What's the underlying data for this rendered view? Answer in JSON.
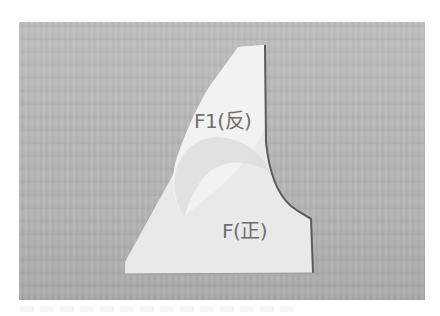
{
  "photo": {
    "description": "White fabric pieces laid on a wooden table, front piece with a curved armhole edge and a folded facing piece on top",
    "colors": {
      "background_wood": "#b8b8b8",
      "fabric": "#e8e8e8",
      "fabric_shadow": "#d6d6d6",
      "edge_stitch": "#5a5a5a",
      "label_text": "#6e6e6e",
      "frame": "#ffffff"
    }
  },
  "labels": {
    "f1": "F1(反)",
    "f": "F(正)"
  }
}
